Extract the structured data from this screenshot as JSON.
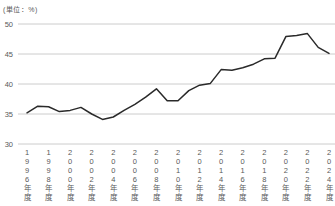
{
  "page": {
    "background": "#ffffff"
  },
  "chart_data": {
    "type": "line",
    "title": "",
    "unit_label": "(単位：%)",
    "ylabel": "",
    "xlabel": "",
    "years": [
      1996,
      1997,
      1998,
      1999,
      2000,
      2001,
      2002,
      2003,
      2004,
      2005,
      2006,
      2007,
      2008,
      2009,
      2010,
      2011,
      2012,
      2013,
      2014,
      2015,
      2016,
      2017,
      2018,
      2019,
      2020,
      2021,
      2022,
      2023,
      2024
    ],
    "values": [
      35.2,
      36.3,
      36.2,
      35.4,
      35.6,
      36.1,
      35.0,
      34.1,
      34.5,
      35.6,
      36.6,
      37.8,
      39.2,
      37.2,
      37.2,
      38.9,
      39.8,
      40.1,
      42.4,
      42.3,
      42.7,
      43.3,
      44.2,
      44.3,
      47.9,
      48.1,
      48.4,
      46.1,
      45.1
    ],
    "x_tick_labels": [
      "1996年度",
      "1998年度",
      "2000年度",
      "2002年度",
      "2004年度",
      "2006年度",
      "2008年度",
      "2010年度",
      "2012年度",
      "2014年度",
      "2016年度",
      "2018年度",
      "2020年度",
      "2022年度",
      "2024年度"
    ],
    "x_tick_step": 2,
    "y_ticks": [
      50,
      45,
      40,
      35,
      30
    ],
    "ylim": [
      30,
      50
    ],
    "grid": true,
    "legend": false,
    "line_color": "#2a2a2a",
    "grid_color": "#bfbfbf",
    "tick_label_color": "#595959"
  }
}
